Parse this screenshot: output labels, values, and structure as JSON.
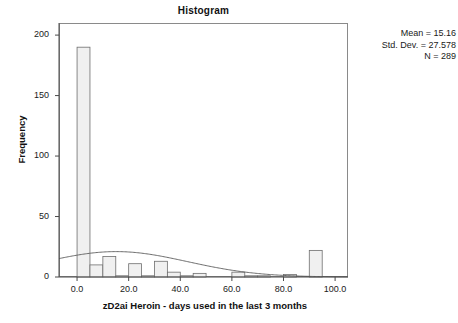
{
  "chart_data": {
    "type": "bar",
    "title": "Histogram",
    "xlabel": "zD2ai Heroin - days used in the last 3 months",
    "ylabel": "Frequency",
    "xlim": [
      -7,
      105
    ],
    "ylim": [
      0,
      210
    ],
    "grid": false,
    "bin_width": 5,
    "x_ticks": [
      "0.0",
      "20.0",
      "40.0",
      "60.0",
      "80.0",
      "100.0"
    ],
    "x_tick_values": [
      0,
      20,
      40,
      60,
      80,
      100
    ],
    "y_ticks": [
      "0",
      "50",
      "100",
      "150",
      "200"
    ],
    "y_tick_values": [
      0,
      50,
      100,
      150,
      200
    ],
    "bin_starts": [
      0,
      5,
      10,
      15,
      20,
      25,
      30,
      35,
      40,
      45,
      50,
      55,
      60,
      65,
      70,
      75,
      80,
      85,
      90,
      95
    ],
    "values": [
      190,
      10,
      17,
      1,
      11,
      1,
      13,
      4,
      1,
      3,
      0,
      0,
      4,
      1,
      1,
      0,
      2,
      0,
      22,
      0
    ],
    "normal_curve": {
      "mean": 15.16,
      "std_dev": 27.578,
      "n": 289,
      "peak_frequency": 21
    },
    "legend_position": "none",
    "bar_fill_color": "#f0f0f0",
    "bar_stroke_color": "#6e6e6e",
    "curve_color": "#5a5a5a"
  },
  "stats": {
    "mean_label": "Mean = 15.16",
    "std_dev_label": "Std. Dev. = 27.578",
    "n_label": "N = 289"
  }
}
